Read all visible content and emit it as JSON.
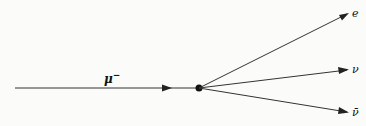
{
  "diagram": {
    "incoming": {
      "label": "μ",
      "superscript": "−"
    },
    "outgoing": [
      {
        "label": "e"
      },
      {
        "label": "ν"
      },
      {
        "label": "ν̄"
      }
    ],
    "colors": {
      "line": "#222222",
      "background": "#fbfbf9"
    }
  }
}
